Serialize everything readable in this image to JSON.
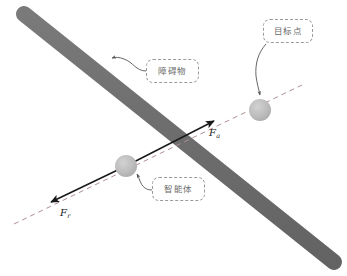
{
  "figure": {
    "type": "artificial-potential-field-diagram",
    "width": 347,
    "height": 276,
    "background_color": "#ffffff"
  },
  "obstacle": {
    "label": "障碍物",
    "shape": "rounded-bar",
    "color": "#6e6e6e",
    "start_point": [
      24,
      14
    ],
    "end_point": [
      334,
      262
    ],
    "thickness": 16
  },
  "target_point": {
    "label": "目标点",
    "shape": "circle",
    "color": "#b4b4b4",
    "center": [
      260,
      110
    ],
    "radius": 11
  },
  "agent": {
    "label": "智能体",
    "shape": "circle",
    "color": "#bfbfbf",
    "center": [
      126,
      166
    ],
    "radius": 11
  },
  "forces": [
    {
      "name": "attractive-force",
      "label": "F",
      "subscript": "a",
      "from": [
        126,
        166
      ],
      "to": [
        217,
        120
      ],
      "color": "#1a1a1a",
      "style": "solid-arrow"
    },
    {
      "name": "repulsive-force",
      "label": "F",
      "subscript": "r",
      "from": [
        126,
        166
      ],
      "to": [
        48,
        204
      ],
      "color": "#1a1a1a",
      "style": "solid-arrow"
    }
  ],
  "axis_line": {
    "name": "force-axis",
    "style": "dashed",
    "color": "#b08f8f",
    "start_point": [
      14,
      224
    ],
    "end_point": [
      302,
      85
    ]
  },
  "callouts": [
    {
      "name": "obstacle-callout",
      "label": "障碍物",
      "border_color": "#9a9a9a",
      "text_color": "#6b6b6b",
      "leader_from": [
        146,
        70
      ],
      "leader_to": [
        112,
        60
      ]
    },
    {
      "name": "target-callout",
      "label": "目标点",
      "border_color": "#9a9a9a",
      "text_color": "#6b6b6b",
      "leader_from": [
        268,
        43
      ],
      "leader_to": [
        260,
        96
      ]
    },
    {
      "name": "agent-callout",
      "label": "智能体",
      "border_color": "#9a9a9a",
      "text_color": "#6b6b6b",
      "leader_from": [
        152,
        190
      ],
      "leader_to": [
        136,
        174
      ]
    }
  ]
}
